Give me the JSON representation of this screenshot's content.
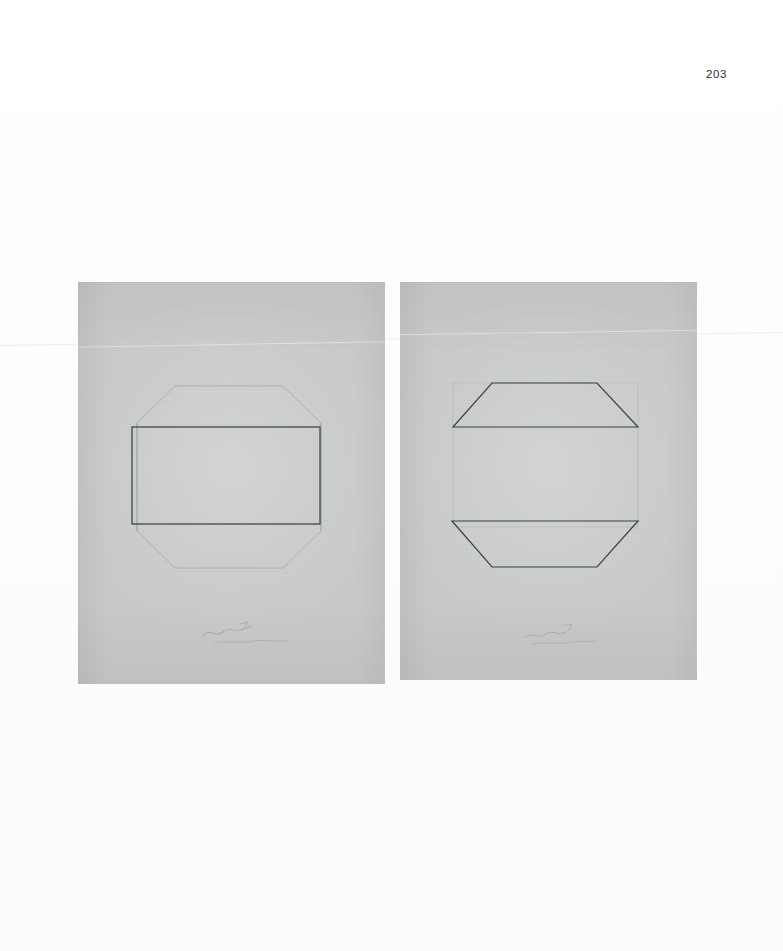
{
  "document": {
    "page_number": "203",
    "page_width": 783,
    "page_height": 951,
    "background_color": "#ffffff",
    "description": "Scanned book page with two photographic plates of minimal geometric pencil drawings on gray paper"
  },
  "plates": [
    {
      "id": "left-plate",
      "name": "octagon-with-rectangle",
      "caption": "",
      "paper_color": "#c8cacb",
      "ink_color": "#3a3d40",
      "faint_color": "#a9acad",
      "x": 78,
      "y": 282,
      "width": 307,
      "height": 402,
      "shapes": [
        {
          "name": "faint-octagon",
          "type": "polygon",
          "stroke": "#a6a9aa",
          "stroke_width": 0.9,
          "points": "97,104 205,104 243,141 243,249 205,286 97,286 59,249 59,141"
        },
        {
          "name": "dark-rectangle",
          "type": "rect",
          "stroke": "#3d4043",
          "stroke_width": 1.25,
          "x": 54,
          "y": 145,
          "width": 188,
          "height": 97
        }
      ],
      "pencil_marks": "illegible pencil signature/date, lower centre"
    },
    {
      "id": "right-plate",
      "name": "two-trapezoids",
      "caption": "",
      "paper_color": "#c8cacb",
      "ink_color": "#3a3d40",
      "faint_color": "#a9acad",
      "x": 400,
      "y": 282,
      "width": 297,
      "height": 398,
      "shapes": [
        {
          "name": "faint-rectangle",
          "type": "rect",
          "stroke": "#b2b5b6",
          "stroke_width": 0.8,
          "x": 53,
          "y": 101,
          "width": 185,
          "height": 144
        },
        {
          "name": "upper-trapezoid",
          "type": "polygon",
          "stroke": "#3d4043",
          "stroke_width": 1.2,
          "points": "92,101 197,101 238,145 53,145"
        },
        {
          "name": "lower-trapezoid",
          "type": "polygon",
          "stroke": "#3d4043",
          "stroke_width": 1.2,
          "points": "52,239 238,239 197,285 92,285"
        }
      ],
      "pencil_marks": "illegible pencil signature/date, lower centre"
    }
  ],
  "scan_artifacts": {
    "crease_label": "horizontal fold line across page",
    "crease_left_y": 344,
    "crease_right_y": 330
  }
}
